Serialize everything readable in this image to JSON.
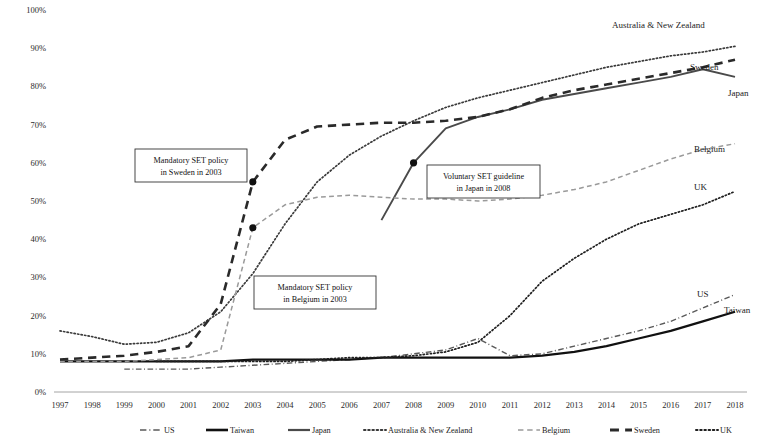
{
  "chart_data": {
    "type": "line",
    "title": "",
    "xlabel": "",
    "ylabel": "",
    "grid": false,
    "legend_position": "bottom",
    "xlim": [
      1997,
      2018
    ],
    "ylim": [
      0,
      100
    ],
    "y_unit": "%",
    "x": [
      1997,
      1998,
      1999,
      2000,
      2001,
      2002,
      2003,
      2004,
      2005,
      2006,
      2007,
      2008,
      2009,
      2010,
      2011,
      2012,
      2013,
      2014,
      2015,
      2016,
      2017,
      2018
    ],
    "categories": [
      "1997",
      "1998",
      "1999",
      "2000",
      "2001",
      "2002",
      "2003",
      "2004",
      "2005",
      "2006",
      "2007",
      "2008",
      "2009",
      "2010",
      "2011",
      "2012",
      "2013",
      "2014",
      "2015",
      "2016",
      "2017",
      "2018"
    ],
    "ytick_labels": [
      "0%",
      "10%",
      "20%",
      "30%",
      "40%",
      "50%",
      "60%",
      "70%",
      "80%",
      "90%",
      "100%"
    ],
    "ytick_values": [
      0,
      10,
      20,
      30,
      40,
      50,
      60,
      70,
      80,
      90,
      100
    ],
    "series": [
      {
        "name": "US",
        "style": "dashdot",
        "color": "#5a5a5a",
        "width": 1.4,
        "end_label": "US",
        "values": [
          null,
          null,
          6,
          6,
          6,
          6.5,
          7,
          7.5,
          8,
          8.5,
          9,
          10,
          11,
          14,
          9.5,
          10,
          12,
          14,
          16,
          18.5,
          22,
          25.5
        ]
      },
      {
        "name": "Taiwan",
        "style": "solid",
        "color": "#111111",
        "width": 2.2,
        "end_label": "Taiwan",
        "values": [
          8,
          8,
          8,
          8,
          8,
          8,
          8.5,
          8.5,
          8.5,
          8.5,
          9,
          9,
          9,
          9,
          9,
          9.5,
          10.5,
          12,
          14,
          16,
          18.5,
          21
        ]
      },
      {
        "name": "Japan",
        "style": "solid",
        "color": "#4a4a4a",
        "width": 1.9,
        "end_label": "Japan",
        "values": [
          null,
          null,
          null,
          null,
          null,
          null,
          null,
          null,
          null,
          null,
          45,
          60,
          69,
          72,
          74,
          76.5,
          78,
          79.5,
          81,
          82.5,
          84.5,
          82.5
        ]
      },
      {
        "name": "Australia & New Zealand",
        "style": "dotted",
        "color": "#3a3a3a",
        "width": 1.7,
        "end_label": "Australia & New Zealand",
        "values": [
          16,
          14.5,
          12.5,
          13,
          15.5,
          21,
          31,
          44,
          55,
          62,
          67,
          71,
          74.5,
          77,
          79,
          81,
          83,
          85,
          86.5,
          88,
          89,
          90.5
        ]
      },
      {
        "name": "Belgium",
        "style": "dashed",
        "color": "#9a9a9a",
        "width": 1.5,
        "end_label": "Belgium",
        "values": [
          8,
          8,
          8,
          8.5,
          9,
          11,
          43,
          49,
          51,
          51.5,
          51,
          50.5,
          50.5,
          50,
          50.5,
          51.5,
          53,
          55,
          58,
          61,
          63.5,
          65
        ]
      },
      {
        "name": "Sweden",
        "style": "dashed",
        "color": "#2a2a2a",
        "width": 2.6,
        "end_label": "Sweden",
        "values": [
          8.5,
          9,
          9.5,
          10.5,
          12,
          23,
          55,
          66,
          69.5,
          70,
          70.5,
          70.5,
          71,
          72,
          74,
          77,
          79,
          80.5,
          82,
          83.5,
          85,
          87
        ]
      },
      {
        "name": "UK",
        "style": "dotted",
        "color": "#1f1f1f",
        "width": 1.7,
        "end_label": "UK",
        "values": [
          null,
          null,
          null,
          8,
          8,
          8,
          8,
          8,
          8.5,
          9,
          9,
          9.5,
          10.5,
          13,
          20,
          29,
          35,
          40,
          44,
          46.5,
          49,
          52.5
        ]
      }
    ],
    "markers": [
      {
        "series": "Sweden",
        "x": 2003,
        "y": 55
      },
      {
        "series": "Belgium",
        "x": 2003,
        "y": 43
      },
      {
        "series": "Japan",
        "x": 2008,
        "y": 60
      }
    ],
    "annotations": [
      {
        "id": "sweden-policy",
        "line1": "Mandatory SET policy",
        "line2": "in Sweden in 2003",
        "box": {
          "x": 135,
          "y": 149,
          "w": 112,
          "h": 33
        },
        "leader_to": {
          "x": 251,
          "y": 186
        }
      },
      {
        "id": "belgium-policy",
        "line1": "Mandatory SET policy",
        "line2": "in Belgium in 2003",
        "box": {
          "x": 254,
          "y": 276,
          "w": 122,
          "h": 33
        },
        "leader_to": {
          "x": 252,
          "y": 238
        }
      },
      {
        "id": "japan-guideline",
        "line1": "Voluntary SET guideline",
        "line2": "in Japan in 2008",
        "box": {
          "x": 427,
          "y": 165,
          "w": 113,
          "h": 33
        },
        "leader_to": {
          "x": 415,
          "y": 196
        }
      }
    ]
  },
  "legend": {
    "items": [
      {
        "label": "US",
        "style": "dashdot",
        "color": "#5a5a5a",
        "width": 1.6
      },
      {
        "label": "Taiwan",
        "style": "solid",
        "color": "#111111",
        "width": 2.6
      },
      {
        "label": "Japan",
        "style": "solid",
        "color": "#4a4a4a",
        "width": 2.2
      },
      {
        "label": "Australia & New Zealand",
        "style": "dotted",
        "color": "#3a3a3a",
        "width": 2.0
      },
      {
        "label": "Belgium",
        "style": "dashed",
        "color": "#9a9a9a",
        "width": 1.7
      },
      {
        "label": "Sweden",
        "style": "dashed",
        "color": "#2a2a2a",
        "width": 2.8
      },
      {
        "label": "UK",
        "style": "dotted",
        "color": "#1f1f1f",
        "width": 2.0
      }
    ]
  },
  "end_labels": [
    {
      "text": "Australia & New Zealand",
      "x": 612,
      "y": 28
    },
    {
      "text": "Sweden",
      "x": 690,
      "y": 70
    },
    {
      "text": "Japan",
      "x": 728,
      "y": 96
    },
    {
      "text": "Belgium",
      "x": 694,
      "y": 152
    },
    {
      "text": "UK",
      "x": 694,
      "y": 190
    },
    {
      "text": "US",
      "x": 697,
      "y": 297
    },
    {
      "text": "Taiwan",
      "x": 724,
      "y": 313
    }
  ]
}
